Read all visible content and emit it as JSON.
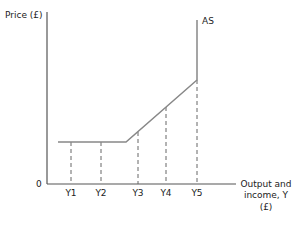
{
  "diagram": {
    "y_axis_label": "Price (£)",
    "origin_label": "0",
    "x_axis_label_lines": [
      "Output and",
      "income, Y",
      "(£)"
    ],
    "curve_label": "AS",
    "x_ticks": [
      "Y1",
      "Y2",
      "Y3",
      "Y4",
      "Y5"
    ],
    "colors": {
      "curve": "#888888",
      "axis": "#555555",
      "dashed": "#666666",
      "text": "#222222"
    }
  }
}
